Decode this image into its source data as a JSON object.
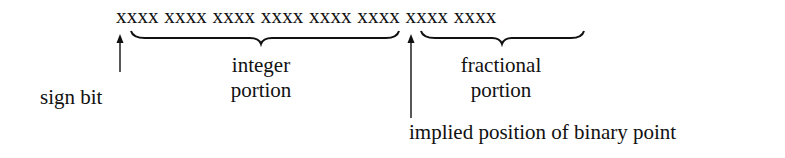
{
  "diagram": {
    "bit_row": "xxxx xxxx xxxx xxxx xxxx xxxx xxxx xxxx",
    "labels": {
      "sign_bit": "sign bit",
      "integer_line1": "integer",
      "integer_line2": "portion",
      "fractional_line1": "fractional",
      "fractional_line2": "portion",
      "binary_point": "implied position of binary point"
    },
    "groups": {
      "integer_nibbles": 5,
      "fractional_nibbles": 3
    },
    "colors": {
      "ink": "#111111",
      "background": "#ffffff"
    }
  }
}
